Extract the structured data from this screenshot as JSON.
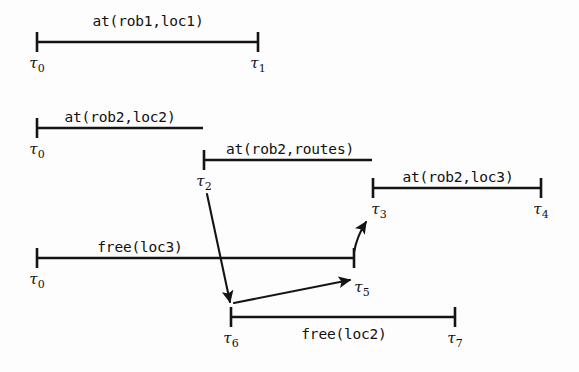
{
  "figure": {
    "type": "timeline-interval-diagram",
    "title": "",
    "background_color": "#fdfdfd",
    "line_color": "#141414"
  },
  "intervals": [
    {
      "id": "at-rob1-loc1",
      "label": "at(rob1,loc1)",
      "label_position": "above",
      "start_tick": "t0",
      "end_tick": "t1",
      "x1": 37,
      "x2": 258,
      "y": 42,
      "label_x": 148,
      "label_y": 26
    },
    {
      "id": "at-rob2-loc2",
      "label": "at(rob2,loc2)",
      "label_position": "above",
      "start_tick": "t0",
      "end_tick": "t2",
      "x1": 37,
      "x2": 203,
      "y": 128,
      "label_x": 120,
      "label_y": 122
    },
    {
      "id": "at-rob2-routes",
      "label": "at(rob2,routes)",
      "label_position": "above",
      "start_tick": "t2",
      "end_tick": "t3",
      "x1": 204,
      "x2": 372,
      "y": 160,
      "label_x": 290,
      "label_y": 154
    },
    {
      "id": "at-rob2-loc3",
      "label": "at(rob2,loc3)",
      "label_position": "above",
      "start_tick": "t3",
      "end_tick": "t4",
      "x1": 373,
      "x2": 541,
      "y": 188,
      "label_x": 458,
      "label_y": 182
    },
    {
      "id": "free-loc3",
      "label": "free(loc3)",
      "label_position": "above",
      "start_tick": "t0",
      "end_tick": "t5",
      "x1": 37,
      "x2": 354,
      "y": 258,
      "label_x": 140,
      "label_y": 252
    },
    {
      "id": "free-loc2",
      "label": "free(loc2)",
      "label_position": "below",
      "start_tick": "t6",
      "end_tick": "t7",
      "x1": 231,
      "x2": 455,
      "y": 317,
      "label_x": 344,
      "label_y": 339
    }
  ],
  "ticks": [
    {
      "id": "t0a",
      "tau": "τ",
      "sub": "0",
      "x": 37,
      "y": 42,
      "label_x": 37,
      "label_y": 68
    },
    {
      "id": "t1",
      "tau": "τ",
      "sub": "1",
      "x": 258,
      "y": 42,
      "label_x": 258,
      "label_y": 68
    },
    {
      "id": "t0b",
      "tau": "τ",
      "sub": "0",
      "x": 37,
      "y": 128,
      "label_x": 37,
      "label_y": 154
    },
    {
      "id": "t2",
      "tau": "τ",
      "sub": "2",
      "x": 204,
      "y": 160,
      "label_x": 204,
      "label_y": 186
    },
    {
      "id": "t3",
      "tau": "τ",
      "sub": "3",
      "x": 373,
      "y": 188,
      "label_x": 379,
      "label_y": 214
    },
    {
      "id": "t4",
      "tau": "τ",
      "sub": "4",
      "x": 541,
      "y": 188,
      "label_x": 541,
      "label_y": 214
    },
    {
      "id": "t0c",
      "tau": "τ",
      "sub": "0",
      "x": 37,
      "y": 258,
      "label_x": 37,
      "label_y": 284
    },
    {
      "id": "t5",
      "tau": "τ",
      "sub": "5",
      "x": 354,
      "y": 258,
      "label_x": 362,
      "label_y": 292
    },
    {
      "id": "t6",
      "tau": "τ",
      "sub": "6",
      "x": 231,
      "y": 317,
      "label_x": 231,
      "label_y": 343
    },
    {
      "id": "t7",
      "tau": "τ",
      "sub": "7",
      "x": 455,
      "y": 317,
      "label_x": 455,
      "label_y": 343
    }
  ],
  "arrows": [
    {
      "id": "arrow-t2-to-t6",
      "from": "t2",
      "to": "t6",
      "x1": 207,
      "y1": 194,
      "x2": 230,
      "y2": 302,
      "curved": false
    },
    {
      "id": "arrow-t6-to-t5",
      "from": "t6",
      "to": "t5",
      "x1": 234,
      "y1": 303,
      "x2": 350,
      "y2": 280,
      "curved": false
    },
    {
      "id": "arrow-t5-to-t3",
      "from": "t5",
      "to": "t3",
      "x1": 354,
      "y1": 252,
      "x2": 366,
      "y2": 222,
      "curved": true,
      "control_x": 357,
      "control_y": 236
    }
  ]
}
